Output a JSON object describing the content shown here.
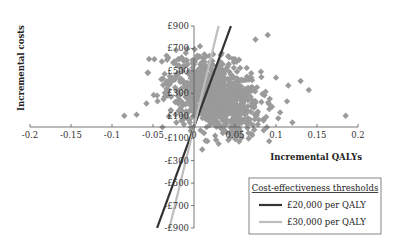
{
  "chart_data": {
    "type": "scatter",
    "title": "",
    "xlabel": "Incremental QALYs",
    "ylabel": "Incremental costs",
    "xlim": [
      -0.2,
      0.2
    ],
    "ylim": [
      -900,
      900
    ],
    "x_ticks": [
      -0.2,
      -0.15,
      -0.1,
      -0.05,
      0,
      0.05,
      0.1,
      0.15,
      0.2
    ],
    "x_tick_labels": [
      "-0.2",
      "-0.15",
      "-0.1",
      "-0.05",
      "0",
      "0.05",
      "0.1",
      "0.15",
      "0.2"
    ],
    "y_ticks": [
      900,
      700,
      500,
      300,
      100,
      -100,
      -300,
      -500,
      -700,
      -900
    ],
    "y_tick_labels": [
      "£900",
      "£700",
      "£500",
      "£300",
      "£100",
      "-£100",
      "-£300",
      "-£500",
      "-£700",
      "-£900"
    ],
    "grid": false,
    "scatter_series": {
      "name": "Bootstrap replicates",
      "color": "#9a9a9a",
      "marker": "diamond",
      "cloud": {
        "center_x": 0.025,
        "center_y": 280,
        "spread_x": 0.028,
        "spread_y": 190,
        "n": 900
      },
      "outliers": [
        {
          "x": -0.085,
          "y": 100
        },
        {
          "x": -0.07,
          "y": 110
        },
        {
          "x": -0.058,
          "y": 210
        },
        {
          "x": -0.045,
          "y": 280
        },
        {
          "x": -0.035,
          "y": 300
        },
        {
          "x": -0.03,
          "y": 420
        },
        {
          "x": -0.025,
          "y": 430
        },
        {
          "x": -0.02,
          "y": 480
        },
        {
          "x": -0.015,
          "y": 620
        },
        {
          "x": -0.01,
          "y": 660
        },
        {
          "x": 0.01,
          "y": 580
        },
        {
          "x": 0.035,
          "y": 560
        },
        {
          "x": 0.055,
          "y": 600
        },
        {
          "x": 0.075,
          "y": 780
        },
        {
          "x": 0.09,
          "y": 820
        },
        {
          "x": 0.1,
          "y": 440
        },
        {
          "x": 0.115,
          "y": 370
        },
        {
          "x": 0.13,
          "y": 410
        },
        {
          "x": 0.14,
          "y": 330
        },
        {
          "x": 0.105,
          "y": 130
        },
        {
          "x": 0.12,
          "y": 40
        },
        {
          "x": 0.185,
          "y": 100
        },
        {
          "x": 0.03,
          "y": -150
        },
        {
          "x": 0.055,
          "y": -130
        },
        {
          "x": 0.07,
          "y": -60
        },
        {
          "x": 0.085,
          "y": -30
        },
        {
          "x": 0.01,
          "y": -200
        },
        {
          "x": 0.045,
          "y": -70
        },
        {
          "x": -0.005,
          "y": 40
        },
        {
          "x": 0.095,
          "y": 180
        }
      ]
    },
    "lines": [
      {
        "name": "£20,000 per QALY",
        "slope": 20000,
        "color": "#333333",
        "width": 2.2
      },
      {
        "name": "£30,000 per QALY",
        "slope": 30000,
        "color": "#bdbdbd",
        "width": 2.2
      }
    ],
    "legend": {
      "title": "Cost-effectiveness thresholds",
      "position": "lower-right",
      "entries": [
        "£20,000 per QALY",
        "£30,000 per QALY"
      ]
    }
  },
  "layout": {
    "origin_px": [
      194,
      127
    ],
    "px_per_qaly": 820,
    "px_per_pound": 0.1122
  }
}
